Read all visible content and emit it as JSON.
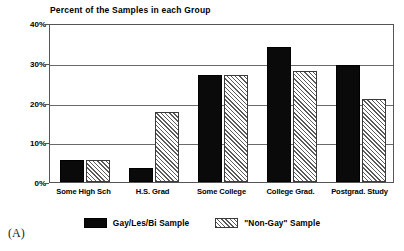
{
  "panel": {
    "caption": "(A)"
  },
  "chart_data": {
    "type": "bar",
    "title": "Percent of the Samples in each Group",
    "xlabel": "",
    "ylabel": "",
    "ylim": [
      0,
      40
    ],
    "yticks": [
      0,
      10,
      20,
      30,
      40
    ],
    "ytick_labels": [
      "0%",
      "10%",
      "20%",
      "30%",
      "40%"
    ],
    "grid": true,
    "legend_position": "bottom-center",
    "categories": [
      "Some High Sch",
      "H.S. Grad",
      "Some College",
      "College Grad.",
      "Postgrad. Study"
    ],
    "series": [
      {
        "name": "Gay/Les/Bi Sample",
        "fill": "solid",
        "color": "#0a0a0a",
        "values": [
          5.5,
          3.5,
          27,
          34,
          29.5
        ]
      },
      {
        "name": "\"Non-Gay\" Sample",
        "fill": "hatched",
        "color": "#5a5a5a",
        "values": [
          5.5,
          17.5,
          27,
          28,
          21
        ]
      }
    ]
  }
}
